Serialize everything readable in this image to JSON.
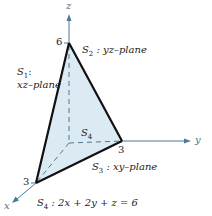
{
  "diagram": {
    "axes": {
      "x_label": "x",
      "y_label": "y",
      "z_label": "z",
      "x_tick": "3",
      "y_tick": "3",
      "z_tick": "6",
      "axis_color": "#4a7a99"
    },
    "surfaces": {
      "s1": {
        "name": "S",
        "sub": "1",
        "line1": ":",
        "desc": "xz–plane"
      },
      "s2": {
        "name": "S",
        "sub": "2",
        "desc": " : yz–plane"
      },
      "s3": {
        "name": "S",
        "sub": "3",
        "desc": " : xy–plane"
      },
      "s4": {
        "name": "S",
        "sub": "4"
      }
    },
    "equation": {
      "name": "S",
      "sub": "4",
      "text": " : 2x + 2y + z = 6"
    },
    "colors": {
      "fill": "#dbeaf3",
      "edge": "#111111",
      "axis": "#4a7a99"
    }
  }
}
